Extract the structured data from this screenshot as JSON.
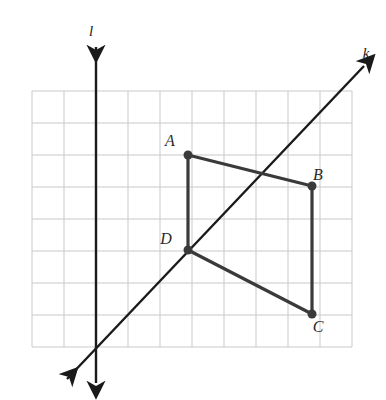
{
  "figure": {
    "background_color": "#ffffff"
  },
  "grid": {
    "origin_x": 32,
    "origin_y": 91,
    "cell_size": 32,
    "cols": 10,
    "rows": 8,
    "line_color": "#c9c9c9",
    "line_width": 1
  },
  "points": [
    {
      "label": "A",
      "x": 188,
      "y": 155,
      "label_x": 170,
      "label_y": 146
    },
    {
      "label": "B",
      "x": 312,
      "y": 186,
      "label_x": 318,
      "label_y": 180
    },
    {
      "label": "C",
      "x": 312,
      "y": 314,
      "label_x": 318,
      "label_y": 332
    },
    {
      "label": "D",
      "x": 188,
      "y": 250,
      "label_x": 166,
      "label_y": 244
    }
  ],
  "point_style": {
    "radius": 4.5,
    "fill_color": "#3a3a3a"
  },
  "segments": [
    {
      "name": "segment-AD",
      "from": "A",
      "to": "D",
      "x1": 188,
      "y1": 155,
      "x2": 188,
      "y2": 250
    },
    {
      "name": "segment-AB",
      "from": "A",
      "to": "B",
      "x1": 188,
      "y1": 155,
      "x2": 312,
      "y2": 186
    },
    {
      "name": "segment-BC",
      "from": "B",
      "to": "C",
      "x1": 312,
      "y1": 186,
      "x2": 312,
      "y2": 314
    },
    {
      "name": "segment-DC",
      "from": "D",
      "to": "C",
      "x1": 188,
      "y1": 250,
      "x2": 312,
      "y2": 314
    }
  ],
  "segment_style": {
    "color": "#3a3a3a",
    "width": 3.2
  },
  "lines": [
    {
      "name": "line-k",
      "label": "k",
      "label_x": 366,
      "label_y": 58,
      "x1": 67,
      "y1": 379,
      "x2": 364,
      "y2": 66,
      "color": "#1a1a1a",
      "width": 2.4,
      "arrows": "both"
    },
    {
      "name": "line-l",
      "label": "l",
      "label_x": 91,
      "label_y": 36,
      "x1": 96,
      "y1": 47,
      "x2": 96,
      "y2": 383,
      "color": "#1a1a1a",
      "width": 2.4,
      "arrows": "both"
    }
  ]
}
